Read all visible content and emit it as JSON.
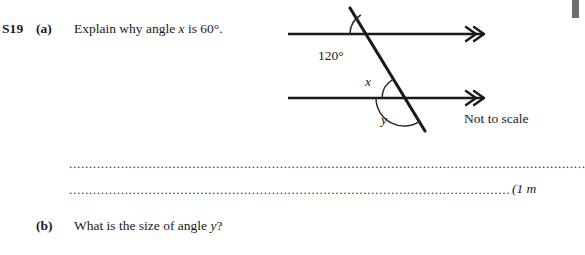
{
  "question": {
    "number": "S19",
    "parts": [
      {
        "label": "(a)",
        "text": "Explain why angle x is 60°.",
        "text_prefix": "Explain why angle ",
        "text_var": "x",
        "text_suffix": " is 60°."
      },
      {
        "label": "(b)",
        "text": "What is the size of angle y?",
        "text_prefix": "What is the size of angle ",
        "text_var": "y",
        "text_suffix": "?"
      }
    ]
  },
  "answer_lines": {
    "line1_dots": "......................................................................................................................................................",
    "line2_dots": "....................................................................................................................",
    "marks": "(1 m"
  },
  "diagram": {
    "caption": "Not to scale",
    "labels": {
      "angle_120": "120°",
      "angle_x": "x",
      "angle_y": "y"
    },
    "colors": {
      "line": "#1a1a1a",
      "arc": "#2b2b2b"
    },
    "geometry": {
      "upper_line_y": 34,
      "lower_line_y": 98,
      "line_start_x": 0,
      "line_end_x": 205,
      "transversal_top": [
        62,
        8
      ],
      "transversal_bottom": [
        137,
        131
      ],
      "intersection_upper": [
        84,
        34
      ],
      "intersection_lower": [
        116,
        98
      ],
      "arrow_style": "double-chevron"
    }
  }
}
